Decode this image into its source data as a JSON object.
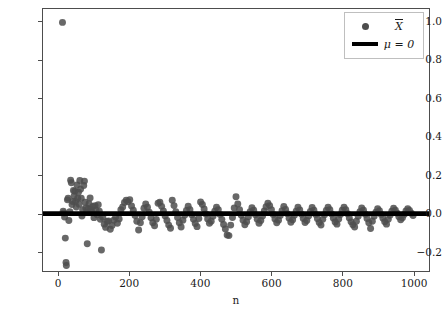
{
  "chart_data": {
    "type": "scatter",
    "title": "",
    "xlabel": "n",
    "ylabel": "",
    "xlim": [
      -45,
      1045
    ],
    "ylim": [
      -0.3,
      1.07
    ],
    "grid": false,
    "legend_position": "upper right",
    "axis_color": "#4d4d4d",
    "marker_color": "#4d4d4d",
    "line_color": "#000000",
    "marker_size": 7,
    "xticks": [
      0,
      200,
      400,
      600,
      800,
      1000
    ],
    "xticklabels": [
      "0",
      "200",
      "400",
      "600",
      "800",
      "1000"
    ],
    "yticks": [
      -0.2,
      0.0,
      0.2,
      0.4,
      0.6,
      0.8,
      1.0
    ],
    "yticklabels": [
      "-0.2",
      "0.0",
      "0.2",
      "0.4",
      "0.6",
      "0.8",
      "1.0"
    ],
    "series": [
      {
        "name": "X-bar",
        "legend_label": "X̄",
        "legend_label_plain": "X",
        "type": "scatter",
        "points": [
          [
            10,
            1.0
          ],
          [
            12,
            0.012
          ],
          [
            14,
            0.003
          ],
          [
            16,
            -0.018
          ],
          [
            18,
            -0.128
          ],
          [
            20,
            -0.256
          ],
          [
            21,
            -0.271
          ],
          [
            24,
            0.072
          ],
          [
            26,
            0.081
          ],
          [
            28,
            -0.036
          ],
          [
            31,
            0.01
          ],
          [
            33,
            0.175
          ],
          [
            35,
            0.161
          ],
          [
            37,
            0.048
          ],
          [
            39,
            0.063
          ],
          [
            41,
            0.121
          ],
          [
            43,
            0.092
          ],
          [
            45,
            0.117
          ],
          [
            47,
            0.064
          ],
          [
            49,
            0.035
          ],
          [
            51,
            0.15
          ],
          [
            53,
            0.08
          ],
          [
            55,
            0.112
          ],
          [
            57,
            0.049
          ],
          [
            59,
            0.173
          ],
          [
            61,
            0.128
          ],
          [
            63,
            0.08
          ],
          [
            65,
            -0.012
          ],
          [
            67,
            0.021
          ],
          [
            70,
            0.147
          ],
          [
            72,
            0.17
          ],
          [
            74,
            0.06
          ],
          [
            76,
            0.03
          ],
          [
            78,
            0.006
          ],
          [
            80,
            -0.158
          ],
          [
            83,
            0.027
          ],
          [
            85,
            0.052
          ],
          [
            88,
            0.082
          ],
          [
            90,
            0.022
          ],
          [
            93,
            0.009
          ],
          [
            96,
            0.038
          ],
          [
            99,
            -0.021
          ],
          [
            102,
            0.042
          ],
          [
            105,
            0.018
          ],
          [
            108,
            -0.006
          ],
          [
            111,
            0.046
          ],
          [
            114,
            0.012
          ],
          [
            117,
            -0.03
          ],
          [
            120,
            -0.19
          ],
          [
            124,
            -0.019
          ],
          [
            128,
            -0.055
          ],
          [
            132,
            -0.072
          ],
          [
            136,
            -0.041
          ],
          [
            140,
            -0.038
          ],
          [
            145,
            -0.082
          ],
          [
            150,
            -0.062
          ],
          [
            155,
            -0.034
          ],
          [
            160,
            -0.018
          ],
          [
            165,
            -0.05
          ],
          [
            170,
            -0.028
          ],
          [
            175,
            0.02
          ],
          [
            180,
            0.035
          ],
          [
            185,
            0.058
          ],
          [
            190,
            0.07
          ],
          [
            195,
            0.062
          ],
          [
            200,
            0.073
          ],
          [
            205,
            0.04
          ],
          [
            210,
            0.018
          ],
          [
            215,
            -0.01
          ],
          [
            220,
            -0.04
          ],
          [
            225,
            -0.086
          ],
          [
            230,
            -0.048
          ],
          [
            235,
            -0.016
          ],
          [
            240,
            0.028
          ],
          [
            245,
            0.05
          ],
          [
            250,
            0.033
          ],
          [
            255,
            0.008
          ],
          [
            260,
            -0.022
          ],
          [
            265,
            -0.048
          ],
          [
            270,
            -0.063
          ],
          [
            275,
            -0.03
          ],
          [
            280,
            0.054
          ],
          [
            285,
            0.06
          ],
          [
            290,
            0.038
          ],
          [
            295,
            0.014
          ],
          [
            300,
            -0.013
          ],
          [
            305,
            -0.036
          ],
          [
            310,
            -0.06
          ],
          [
            315,
            -0.076
          ],
          [
            320,
            0.07
          ],
          [
            325,
            0.042
          ],
          [
            330,
            0.01
          ],
          [
            335,
            -0.02
          ],
          [
            340,
            -0.048
          ],
          [
            345,
            -0.07
          ],
          [
            350,
            -0.035
          ],
          [
            355,
            -0.008
          ],
          [
            360,
            0.017
          ],
          [
            365,
            0.039
          ],
          [
            370,
            0.02
          ],
          [
            375,
            -0.006
          ],
          [
            380,
            -0.03
          ],
          [
            385,
            -0.052
          ],
          [
            390,
            -0.068
          ],
          [
            395,
            -0.025
          ],
          [
            400,
            0.061
          ],
          [
            405,
            0.048
          ],
          [
            410,
            0.024
          ],
          [
            415,
            -0.002
          ],
          [
            420,
            -0.028
          ],
          [
            425,
            -0.05
          ],
          [
            430,
            -0.04
          ],
          [
            435,
            -0.014
          ],
          [
            440,
            0.012
          ],
          [
            445,
            0.034
          ],
          [
            450,
            0.021
          ],
          [
            455,
            -0.004
          ],
          [
            460,
            -0.03
          ],
          [
            465,
            -0.057
          ],
          [
            470,
            -0.08
          ],
          [
            475,
            -0.112
          ],
          [
            480,
            -0.115
          ],
          [
            485,
            -0.06
          ],
          [
            490,
            -0.02
          ],
          [
            495,
            0.03
          ],
          [
            500,
            0.088
          ],
          [
            505,
            0.05
          ],
          [
            510,
            0.02
          ],
          [
            515,
            -0.008
          ],
          [
            520,
            -0.035
          ],
          [
            525,
            -0.058
          ],
          [
            530,
            -0.042
          ],
          [
            535,
            -0.016
          ],
          [
            540,
            0.01
          ],
          [
            545,
            0.031
          ],
          [
            550,
            0.018
          ],
          [
            555,
            -0.006
          ],
          [
            560,
            -0.029
          ],
          [
            565,
            -0.05
          ],
          [
            570,
            -0.036
          ],
          [
            575,
            -0.012
          ],
          [
            580,
            0.014
          ],
          [
            585,
            0.036
          ],
          [
            590,
            0.055
          ],
          [
            595,
            0.042
          ],
          [
            600,
            0.02
          ],
          [
            605,
            -0.004
          ],
          [
            610,
            -0.028
          ],
          [
            615,
            -0.048
          ],
          [
            620,
            -0.034
          ],
          [
            625,
            -0.01
          ],
          [
            630,
            0.015
          ],
          [
            635,
            0.038
          ],
          [
            640,
            0.022
          ],
          [
            645,
            0.0
          ],
          [
            650,
            -0.024
          ],
          [
            655,
            -0.045
          ],
          [
            660,
            -0.032
          ],
          [
            665,
            -0.009
          ],
          [
            670,
            0.013
          ],
          [
            675,
            0.034
          ],
          [
            680,
            0.019
          ],
          [
            685,
            -0.003
          ],
          [
            690,
            -0.026
          ],
          [
            695,
            -0.046
          ],
          [
            700,
            -0.036
          ],
          [
            705,
            -0.012
          ],
          [
            710,
            0.011
          ],
          [
            715,
            0.032
          ],
          [
            720,
            0.018
          ],
          [
            725,
            -0.004
          ],
          [
            730,
            -0.027
          ],
          [
            735,
            -0.047
          ],
          [
            740,
            -0.06
          ],
          [
            745,
            -0.03
          ],
          [
            750,
            -0.006
          ],
          [
            755,
            0.016
          ],
          [
            760,
            0.033
          ],
          [
            765,
            0.02
          ],
          [
            770,
            -0.002
          ],
          [
            775,
            -0.024
          ],
          [
            780,
            -0.044
          ],
          [
            785,
            -0.055
          ],
          [
            790,
            -0.028
          ],
          [
            795,
            -0.005
          ],
          [
            800,
            0.018
          ],
          [
            805,
            0.034
          ],
          [
            810,
            0.02
          ],
          [
            815,
            -0.001
          ],
          [
            820,
            -0.023
          ],
          [
            825,
            -0.043
          ],
          [
            830,
            -0.058
          ],
          [
            835,
            -0.07
          ],
          [
            840,
            -0.04
          ],
          [
            845,
            -0.014
          ],
          [
            850,
            0.01
          ],
          [
            855,
            0.03
          ],
          [
            860,
            0.018
          ],
          [
            865,
            -0.003
          ],
          [
            870,
            -0.025
          ],
          [
            875,
            -0.048
          ],
          [
            880,
            -0.078
          ],
          [
            885,
            -0.04
          ],
          [
            890,
            -0.014
          ],
          [
            895,
            0.008
          ],
          [
            900,
            0.026
          ],
          [
            905,
            0.015
          ],
          [
            910,
            -0.004
          ],
          [
            915,
            -0.024
          ],
          [
            920,
            -0.042
          ],
          [
            925,
            -0.055
          ],
          [
            930,
            -0.03
          ],
          [
            935,
            -0.008
          ],
          [
            940,
            0.012
          ],
          [
            945,
            0.028
          ],
          [
            950,
            0.018
          ],
          [
            955,
            0.002
          ],
          [
            960,
            -0.016
          ],
          [
            965,
            -0.032
          ],
          [
            970,
            -0.022
          ],
          [
            975,
            -0.004
          ],
          [
            980,
            0.014
          ],
          [
            985,
            0.026
          ],
          [
            990,
            0.016
          ],
          [
            995,
            0.002
          ],
          [
            1000,
            -0.01
          ]
        ]
      },
      {
        "name": "mu",
        "legend_label": "μ = 0",
        "type": "hline",
        "y": 0.0
      }
    ]
  },
  "legend": {
    "entries": [
      {
        "symbol": "dot",
        "label_base": "X",
        "label": "X̄"
      },
      {
        "symbol": "line",
        "label": "μ = 0"
      }
    ]
  },
  "axes": {
    "xlabel": "n",
    "xticklabels": [
      "0",
      "200",
      "400",
      "600",
      "800",
      "1000"
    ],
    "yticklabels": [
      "1.0",
      "0.8",
      "0.6",
      "0.4",
      "0.2",
      "0.0",
      "-0.2"
    ]
  }
}
